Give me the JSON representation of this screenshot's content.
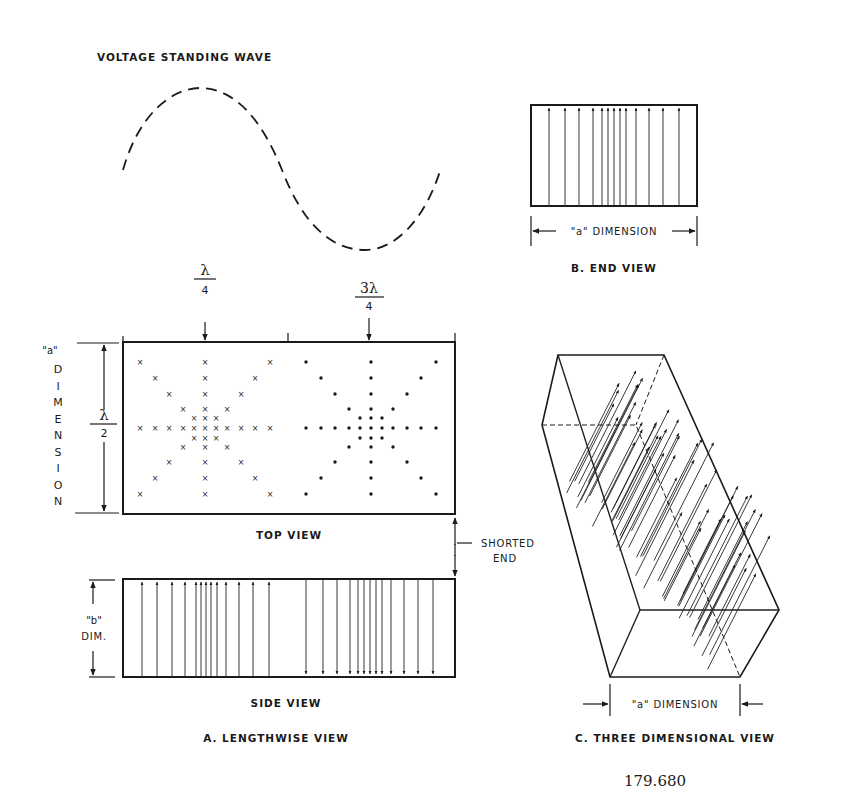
{
  "diagram": {
    "title": "VOLTAGE STANDING WAVE",
    "wave": {
      "style": "dashed",
      "description": "Sine wave: rises from left to peak, falls to trough, rises at right"
    },
    "end_view": {
      "caption": "B. END VIEW",
      "dimension_label": "\"a\" DIMENSION",
      "arrow_direction": "up",
      "arrow_count": 13
    },
    "lengthwise_view": {
      "caption": "A. LENGTHWISE VIEW",
      "top_view": {
        "caption": "TOP VIEW",
        "markers": {
          "quarter_wave": {
            "numerator": "λ",
            "denominator": "4"
          },
          "three_quarter_wave": {
            "numerator": "3λ",
            "denominator": "4"
          }
        },
        "left_pattern_symbol": "×",
        "right_pattern_symbol": "•",
        "left_dimension": {
          "quote_label": "\"a\"",
          "letters": [
            "D",
            "I",
            "M",
            "E",
            "N",
            "S",
            "I",
            "O",
            "N"
          ],
          "fraction": {
            "numerator": "λ",
            "denominator": "2"
          }
        }
      },
      "side_view": {
        "caption": "SIDE VIEW",
        "dim_label_line1": "\"b\"",
        "dim_label_line2": "DIM.",
        "left_group_direction": "up",
        "right_group_direction": "down"
      },
      "shorted_end": {
        "line1": "SHORTED",
        "line2": "END"
      }
    },
    "three_d_view": {
      "caption": "C. THREE DIMENSIONAL VIEW",
      "dimension_label": "\"a\" DIMENSION"
    },
    "figure_number": "179.680"
  }
}
